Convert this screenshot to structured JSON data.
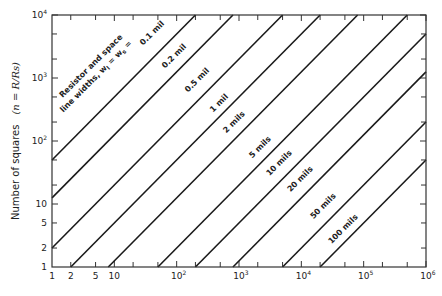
{
  "chart_data": {
    "type": "line",
    "title": "",
    "xlabel": "",
    "ylabel": "Number of squares",
    "ylabel_formula": "(n = R/Rs)",
    "x_scale": "log",
    "y_scale": "log",
    "xlim": [
      1,
      1000000
    ],
    "ylim": [
      1,
      10000
    ],
    "grid": false,
    "x_ticks_major": [
      {
        "value": 1,
        "label": "1"
      },
      {
        "value": 2,
        "label": "2"
      },
      {
        "value": 5,
        "label": "5"
      },
      {
        "value": 10,
        "label": "10"
      },
      {
        "value": 100,
        "label": "10",
        "sup": "2"
      },
      {
        "value": 1000,
        "label": "10",
        "sup": "3"
      },
      {
        "value": 10000,
        "label": "10",
        "sup": "4"
      },
      {
        "value": 100000,
        "label": "10",
        "sup": "5"
      },
      {
        "value": 1000000,
        "label": "10",
        "sup": "6"
      }
    ],
    "y_ticks_major": [
      {
        "value": 1,
        "label": "1"
      },
      {
        "value": 2,
        "label": "2"
      },
      {
        "value": 5,
        "label": "5"
      },
      {
        "value": 10,
        "label": "10"
      },
      {
        "value": 100,
        "label": "10",
        "sup": "2"
      },
      {
        "value": 1000,
        "label": "10",
        "sup": "3"
      },
      {
        "value": 10000,
        "label": "10",
        "sup": "4"
      }
    ],
    "minor_tick_multiples": [
      2,
      5
    ],
    "annotation": {
      "line1": "Resistor and space",
      "line2": "line widths, w",
      "sub1": "l",
      "eq1": " = w",
      "sub2": "s",
      "eq2": " ="
    },
    "relation": "n = x / (2 w^2)",
    "series": [
      {
        "name": "0.1 mil",
        "width_mil": 0.1,
        "points": [
          [
            1,
            50
          ],
          [
            200,
            10000
          ]
        ],
        "label_pos": [
          156,
          37
        ]
      },
      {
        "name": "0.2 mil",
        "width_mil": 0.2,
        "points": [
          [
            1,
            12.5
          ],
          [
            800,
            10000
          ]
        ],
        "label_pos": [
          178,
          60
        ]
      },
      {
        "name": "0.5 mil",
        "width_mil": 0.5,
        "points": [
          [
            1,
            2
          ],
          [
            5000,
            10000
          ]
        ],
        "label_pos": [
          201,
          84
        ]
      },
      {
        "name": "1 mil",
        "width_mil": 1,
        "points": [
          [
            2,
            1
          ],
          [
            20000,
            10000
          ]
        ],
        "label_pos": [
          223,
          107
        ]
      },
      {
        "name": "2 mils",
        "width_mil": 2,
        "points": [
          [
            8,
            1
          ],
          [
            80000,
            10000
          ]
        ],
        "label_pos": [
          238,
          126
        ]
      },
      {
        "name": "5 mils",
        "width_mil": 5,
        "points": [
          [
            50,
            1
          ],
          [
            500000,
            10000
          ]
        ],
        "label_pos": [
          264,
          151
        ]
      },
      {
        "name": "10 mils",
        "width_mil": 10,
        "points": [
          [
            200,
            1
          ],
          [
            1000000,
            5000
          ]
        ],
        "label_pos": [
          283,
          167
        ]
      },
      {
        "name": "20 mils",
        "width_mil": 20,
        "points": [
          [
            800,
            1
          ],
          [
            1000000,
            1250
          ]
        ],
        "label_pos": [
          304,
          183
        ]
      },
      {
        "name": "50 mils",
        "width_mil": 50,
        "points": [
          [
            5000,
            1
          ],
          [
            1000000,
            200
          ]
        ],
        "label_pos": [
          327,
          210
        ]
      },
      {
        "name": "100 mils",
        "width_mil": 100,
        "points": [
          [
            20000,
            1
          ],
          [
            1000000,
            50
          ]
        ],
        "label_pos": [
          347,
          233
        ]
      }
    ]
  },
  "layout": {
    "plot": {
      "x0": 52,
      "x1": 426,
      "y0": 267,
      "y1": 15
    },
    "line_color": "#1a1a1a",
    "axis_color": "#333333"
  }
}
